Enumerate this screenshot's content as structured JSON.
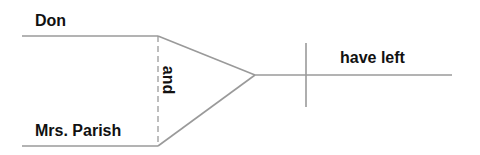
{
  "diagram": {
    "type": "sentence-diagram",
    "compound_subject": {
      "subjects": [
        {
          "text": "Don"
        },
        {
          "text": "Mrs. Parish"
        }
      ],
      "conjunction": {
        "text": "and",
        "orientation": "rotated-90-clockwise"
      }
    },
    "predicate": {
      "verb": {
        "text": "have left"
      }
    },
    "colors": {
      "line": "#9a9a9a",
      "text": "#111111",
      "background": "#ffffff"
    },
    "geometry": {
      "top_line": {
        "x1": 22,
        "y1": 36,
        "x2": 158,
        "y2": 36
      },
      "bottom_line": {
        "x1": 22,
        "y1": 146,
        "x2": 158,
        "y2": 146
      },
      "dashed_connector": {
        "x1": 158,
        "y1": 36,
        "x2": 158,
        "y2": 146
      },
      "fork_top": {
        "x1": 158,
        "y1": 36,
        "x2": 255,
        "y2": 75
      },
      "fork_bottom": {
        "x1": 158,
        "y1": 146,
        "x2": 255,
        "y2": 75
      },
      "baseline": {
        "x1": 255,
        "y1": 75,
        "x2": 452,
        "y2": 75
      },
      "subject_predicate_divider": {
        "x1": 306,
        "y1": 43,
        "x2": 306,
        "y2": 107
      }
    }
  }
}
